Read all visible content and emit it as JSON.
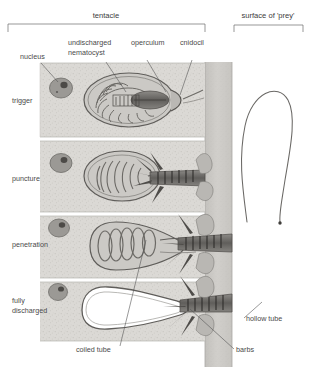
{
  "figure": {
    "title_regions": [
      {
        "id": "tentacle",
        "label": "tentacle"
      },
      {
        "id": "prey",
        "label": "surface of 'prey'"
      }
    ],
    "callouts": [
      {
        "id": "nucleus",
        "label": "nucleus"
      },
      {
        "id": "undischarged-nematocyst",
        "label": "undischarged",
        "label2": "nematocyst"
      },
      {
        "id": "operculum",
        "label": "operculum"
      },
      {
        "id": "cnidocil",
        "label": "cnidocil"
      },
      {
        "id": "coiled-tube",
        "label": "coiled tube"
      },
      {
        "id": "hollow-tube",
        "label": "hollow tube"
      },
      {
        "id": "barbs",
        "label": "barbs"
      }
    ],
    "stages": [
      {
        "id": "trigger",
        "label": "trigger",
        "label2": ""
      },
      {
        "id": "puncture",
        "label": "puncture",
        "label2": ""
      },
      {
        "id": "penetration",
        "label": "penetration",
        "label2": ""
      },
      {
        "id": "fully-discharged",
        "label": "fully",
        "label2": "discharged"
      }
    ],
    "colors": {
      "background": "#ffffff",
      "tissue": "#d8d6d2",
      "tissue_dark": "#c3c1bc",
      "prey_band": "#c9c7c3",
      "capsule_outline": "#6e6c68",
      "nucleus": "#8f8d89",
      "nucleolus": "#4c4a47",
      "shaft": "#7a7874",
      "barb": "#4e4c49",
      "thread": "#6a6865",
      "text": "#4a4a4a",
      "leader": "#555555"
    }
  }
}
